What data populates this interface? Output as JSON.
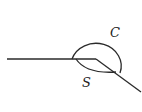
{
  "diagram": {
    "type": "angle-arcs",
    "labels": {
      "large_arc": "C",
      "small_arc": "S"
    },
    "colors": {
      "stroke": "#2a2a2a",
      "background": "#ffffff"
    },
    "geometry": {
      "horizontal_ray": {
        "x1": 7,
        "y1": 59,
        "x2": 96,
        "y2": 59
      },
      "diagonal_ray": {
        "x1": 96,
        "y1": 59,
        "x2": 141,
        "y2": 92
      },
      "large_arc_path": "M 72 59 A 24.5 22 0 1 1 120 73",
      "small_arc_path": "M 76 59 Q 86 74 116 72"
    }
  }
}
